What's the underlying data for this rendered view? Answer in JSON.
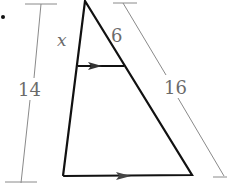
{
  "diagram": {
    "labels": {
      "x": "x",
      "top_right_segment": "6",
      "left_total": "14",
      "right_total": "16"
    },
    "colors": {
      "triangle": "#111111",
      "measure": "#8a8a8a",
      "text": "#6b6b6b"
    },
    "bullet": "•"
  }
}
